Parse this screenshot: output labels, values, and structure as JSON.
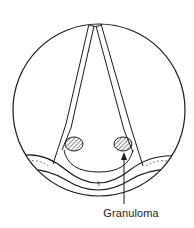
{
  "diagram": {
    "type": "anatomical-illustration",
    "labels": {
      "granuloma": "Granuloma"
    },
    "elements": {
      "field_circle": {
        "cx": 99,
        "cy": 110,
        "r": 86
      },
      "masses": [
        {
          "name": "left-mass",
          "cx": 74,
          "cy": 144,
          "rx": 9,
          "ry": 7,
          "hatched": true
        },
        {
          "name": "right-mass",
          "cx": 123,
          "cy": 144,
          "rx": 9,
          "ry": 7,
          "hatched": true
        }
      ],
      "arrow": {
        "from": [
          124,
          200
        ],
        "to": [
          124,
          154
        ],
        "target": "right-mass"
      }
    },
    "colors": {
      "stroke": "#1a1a1a",
      "background": "#ffffff"
    }
  }
}
